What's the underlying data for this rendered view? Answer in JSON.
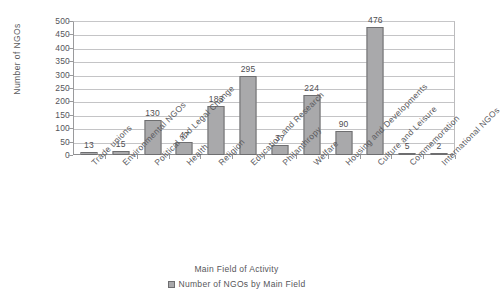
{
  "chart_data": {
    "type": "bar",
    "title": "",
    "subtitle": "",
    "xlabel": "Main Field of Activity",
    "ylabel": "Number of NGOs",
    "ylim": [
      0,
      500
    ],
    "ytick_step": 50,
    "yticks": [
      "500",
      "450",
      "400",
      "350",
      "300",
      "250",
      "200",
      "150",
      "100",
      "50",
      "0"
    ],
    "grid": true,
    "legend_position": "bottom",
    "legend": [
      "Number of NGOs by Main Field"
    ],
    "categories": [
      "Trade unions",
      "Environmental NGOs",
      "Political and Legal Change",
      "Health",
      "Religion",
      "Education and Research",
      "Philanthropy",
      "Welfare",
      "Housing and Developments",
      "Culture and Leisure",
      "Commemoration",
      "International NGOs"
    ],
    "series": [
      {
        "name": "Number of NGOs by Main Field",
        "values": [
          13,
          15,
          130,
          47,
          183,
          295,
          37,
          224,
          90,
          476,
          5,
          2
        ],
        "color": "#a9a9ab"
      }
    ],
    "data_labels": [
      "13",
      "15",
      "130",
      "47",
      "183",
      "295",
      "37",
      "224",
      "90",
      "476",
      "5",
      "2"
    ]
  },
  "colors": {
    "bar_fill": "#a9a9ab",
    "bar_border": "#6e6e70",
    "gridline": "#c4c4c6",
    "axis": "#8e8e90",
    "text": "#56565a",
    "background": "#ffffff"
  }
}
